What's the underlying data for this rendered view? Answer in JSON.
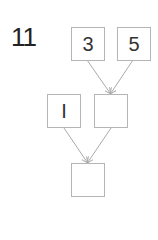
{
  "problem": {
    "number": "11"
  },
  "diagram": {
    "top_left": "3",
    "top_right": "5",
    "middle_left": "I",
    "middle_right": "",
    "bottom": ""
  },
  "colors": {
    "box_border": "#b5b5b5",
    "arrow": "#aaaaaa"
  }
}
